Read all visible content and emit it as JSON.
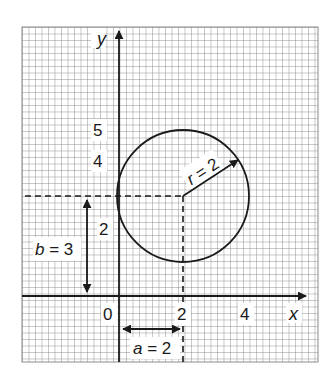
{
  "diagram": {
    "colors": {
      "background": "#ffffff",
      "grid": "#8a8a8a",
      "ink": "#1a1a1a"
    },
    "axes": {
      "x_label": "x",
      "y_label": "y",
      "origin_label": "0",
      "x_ticks": [
        {
          "value": 2,
          "label": "2"
        },
        {
          "value": 4,
          "label": "4"
        }
      ],
      "y_ticks": [
        {
          "value": 2,
          "label": "2"
        },
        {
          "value": 4,
          "label": "4"
        },
        {
          "value": 5,
          "label": "5"
        }
      ]
    },
    "circle": {
      "center": {
        "x": 2,
        "y": 3
      },
      "radius": 2
    },
    "annotations": {
      "radius_label": "r = 2",
      "a_label": "a = 2",
      "b_label": "b = 3"
    }
  }
}
